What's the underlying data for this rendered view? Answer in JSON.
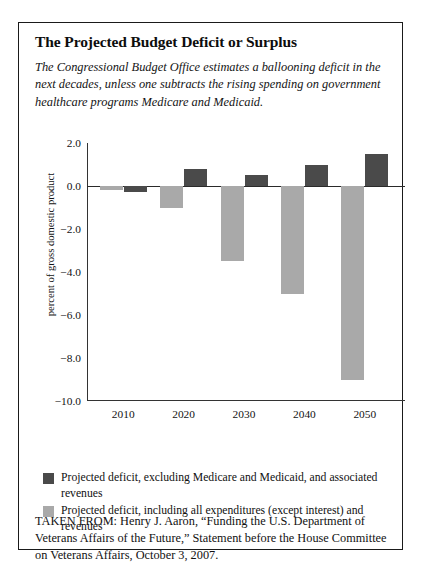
{
  "figure": {
    "title": "The Projected Budget Deficit or Surplus",
    "subtitle": "The Congressional Budget Office estimates a ballooning deficit in the next decades, unless one subtracts the rising spending on government healthcare programs Medicare and Medicaid.",
    "source_note": "TAKEN FROM: Henry J. Aaron, “Funding the U.S. Department of Veterans Affairs of the Future,” Statement before the House Committee on Veterans Affairs, October 3, 2007."
  },
  "colors": {
    "series_dark": "#4a4a4a",
    "series_light": "#a9a9a9",
    "axis": "#333333",
    "border": "#1a1a1a",
    "text": "#111111"
  },
  "chart_data": {
    "type": "bar",
    "title": "The Projected Budget Deficit or Surplus",
    "xlabel": "",
    "ylabel": "percent of gross domestic product",
    "categories": [
      "2010",
      "2020",
      "2030",
      "2040",
      "2050"
    ],
    "ylim": [
      -10.0,
      2.0
    ],
    "yticks": [
      2.0,
      0.0,
      -2.0,
      -4.0,
      -6.0,
      -8.0,
      -10.0
    ],
    "ytick_labels": [
      "2.0",
      "0.0",
      "−2.0",
      "−4.0",
      "−6.0",
      "−8.0",
      "−10.0"
    ],
    "grid": false,
    "legend_position": "below-plot",
    "series": [
      {
        "name": "Projected deficit, excluding Medicare and Medicaid, and associated revenues",
        "color": "#4a4a4a",
        "values": [
          -0.3,
          0.8,
          0.5,
          1.0,
          1.5
        ]
      },
      {
        "name": "Projected deficit, including all expenditures (except interest) and revenues",
        "color": "#a9a9a9",
        "values": [
          -0.2,
          -1.0,
          -3.5,
          -5.0,
          -9.0
        ]
      }
    ]
  }
}
